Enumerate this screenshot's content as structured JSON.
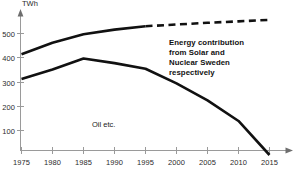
{
  "chart_data": {
    "type": "line",
    "title": "",
    "xlabel": "",
    "ylabel": "TWh",
    "y_unit_label": "TWh",
    "xlim": [
      1975,
      2017
    ],
    "ylim": [
      0,
      580
    ],
    "grid": false,
    "legend_position": "none",
    "x_ticks": [
      "1975",
      "1980",
      "1985",
      "1990",
      "1995",
      "2000",
      "2005",
      "2010",
      "2015"
    ],
    "y_ticks": [
      "100",
      "200",
      "300",
      "400",
      "500"
    ],
    "x": [
      1975,
      1980,
      1985,
      1990,
      1995,
      2000,
      2005,
      2010,
      2015
    ],
    "series": [
      {
        "name": "Total energy (Solar and Nuclear Sweden)",
        "values": [
          415,
          462,
          497,
          516,
          530,
          537,
          544,
          550,
          556
        ],
        "style": "solid-then-dashed",
        "dash_starts_at": 1995,
        "color": "#111111"
      },
      {
        "name": "Oil etc.",
        "values": [
          313,
          352,
          397,
          378,
          355,
          295,
          225,
          140,
          0
        ],
        "style": "solid",
        "color": "#111111"
      }
    ],
    "annotations": [
      {
        "id": "energy-contribution-note",
        "lines": [
          "Energy contribution",
          "from Solar and",
          "Nuclear Sweden",
          "respectively"
        ],
        "x": 2000,
        "y": 430
      },
      {
        "id": "oil-etc-label",
        "lines": [
          "Oil etc."
        ],
        "x": 1988,
        "y": 108
      }
    ]
  },
  "axis": {
    "unit": "TWh",
    "y_labels": [
      "500",
      "400",
      "300",
      "200",
      "100"
    ],
    "x_labels": [
      "1975",
      "1980",
      "1985",
      "1990",
      "1995",
      "2000",
      "2005",
      "2010",
      "2015"
    ]
  },
  "annotations": {
    "note_line_1": "Energy contribution",
    "note_line_2": "from Solar and",
    "note_line_3": "Nuclear Sweden",
    "note_line_4": "respectively",
    "oil_label": "Oil etc."
  },
  "colors": {
    "line": "#111111",
    "axis": "#9a9a9a",
    "text": "#2b2b2b",
    "background": "#ffffff"
  }
}
